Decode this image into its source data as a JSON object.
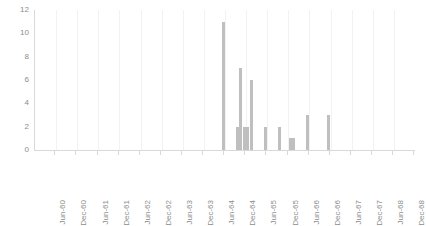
{
  "chart_data": {
    "type": "bar",
    "title": "",
    "subtitle": "",
    "xlabel": "",
    "ylabel": "",
    "ylim": [
      0,
      12
    ],
    "yticks": [
      0,
      2,
      4,
      6,
      8,
      10,
      12
    ],
    "grid": true,
    "legend": null,
    "legend_position": "none",
    "bar_color": "#bfbfbf",
    "axis_color": "#d9d9d9",
    "gridline_color": "#f2f2f2",
    "tick_label_color": "#8c8c8c",
    "xtick_labels": [
      "Jun-60",
      "Dec-60",
      "Jun-61",
      "Dec-61",
      "Jun-62",
      "Dec-62",
      "Jun-63",
      "Dec-63",
      "Jun-64",
      "Dec-64",
      "Jun-65",
      "Dec-65",
      "Jun-66",
      "Dec-66",
      "Jun-67",
      "Dec-67",
      "Jun-68",
      "Dec-68"
    ],
    "xtick_label_rotation": 90,
    "note": "x axis is a monthly series spanning Jan-60 to Dec-68; only every 6th month is labelled. All bars are zero except the months listed in non_zero_bars.",
    "x_start": "Jan-60",
    "x_end": "Dec-68",
    "n_categories": 108,
    "non_zero_bars": [
      {
        "category": "Jun-64",
        "value": 11
      },
      {
        "category": "Oct-64",
        "value": 2
      },
      {
        "category": "Nov-64",
        "value": 7
      },
      {
        "category": "Dec-64",
        "value": 2
      },
      {
        "category": "Jan-65",
        "value": 2
      },
      {
        "category": "Feb-65",
        "value": 6
      },
      {
        "category": "Jun-65",
        "value": 2
      },
      {
        "category": "Oct-65",
        "value": 2
      },
      {
        "category": "Jan-66",
        "value": 1
      },
      {
        "category": "Feb-66",
        "value": 1
      },
      {
        "category": "Jun-66",
        "value": 3
      },
      {
        "category": "Dec-66",
        "value": 3
      }
    ]
  }
}
